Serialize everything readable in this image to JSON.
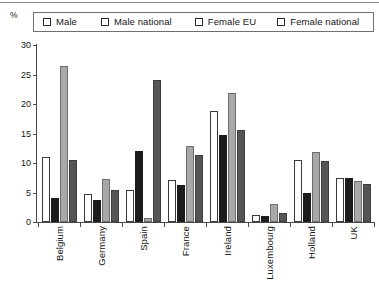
{
  "chart_data": {
    "type": "bar",
    "title": "",
    "subtitle": "",
    "xlabel": "",
    "ylabel": "%",
    "ylim": [
      0,
      30
    ],
    "yticks": [
      0,
      5,
      10,
      15,
      20,
      25,
      30
    ],
    "grid": false,
    "legend_position": "top",
    "categories": [
      "Belgium",
      "Germany",
      "Spain",
      "France",
      "Ireland",
      "Luxembourg",
      "Holland",
      "UK"
    ],
    "series": [
      {
        "name": "Male",
        "color": "#ffffff",
        "values": [
          11.0,
          4.7,
          5.4,
          7.1,
          18.8,
          1.2,
          10.5,
          7.4
        ]
      },
      {
        "name": "Male national",
        "color": "#1c1c1c",
        "values": [
          4.0,
          3.8,
          12.0,
          6.3,
          14.7,
          1.0,
          4.9,
          7.4
        ]
      },
      {
        "name": "Female EU",
        "color": "#a8a8a8",
        "values": [
          26.5,
          7.3,
          0.6,
          12.9,
          21.8,
          3.0,
          11.9,
          7.0
        ]
      },
      {
        "name": "Female national",
        "color": "#555555",
        "values": [
          10.5,
          5.5,
          24.0,
          11.3,
          15.6,
          1.5,
          10.3,
          6.4
        ]
      }
    ]
  },
  "axis": {
    "unit_label": "%"
  }
}
